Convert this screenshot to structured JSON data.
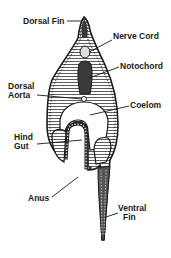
{
  "diagram": {
    "colors": {
      "ink": "#1a1a1a",
      "fill_dark": "#3a3a3a",
      "background": "#ffffff"
    },
    "labels": [
      {
        "id": "dorsal-fin",
        "text": "Dorsal Fin",
        "lines": [
          "Dorsal Fin"
        ],
        "x": 23,
        "y": 17
      },
      {
        "id": "nerve-cord",
        "text": "Nerve Cord",
        "lines": [
          "Nerve Cord"
        ],
        "x": 113,
        "y": 32
      },
      {
        "id": "notochord",
        "text": "Notochord",
        "lines": [
          "Notochord"
        ],
        "x": 120,
        "y": 62
      },
      {
        "id": "dorsal-aorta",
        "text": "Dorsal Aorta",
        "lines": [
          "Dorsal",
          "Aorta"
        ],
        "x": 8,
        "y": 82
      },
      {
        "id": "coelom",
        "text": "Coelom",
        "lines": [
          "Coelom"
        ],
        "x": 130,
        "y": 101
      },
      {
        "id": "hind-gut",
        "text": "Hind Gut",
        "lines": [
          "Hind",
          "Gut"
        ],
        "x": 14,
        "y": 133
      },
      {
        "id": "anus",
        "text": "Anus",
        "lines": [
          "Anus"
        ],
        "x": 28,
        "y": 194
      },
      {
        "id": "ventral-fin",
        "text": "Ventral Fin",
        "lines": [
          "Ventral",
          "Fin"
        ],
        "x": 118,
        "y": 204
      }
    ]
  }
}
